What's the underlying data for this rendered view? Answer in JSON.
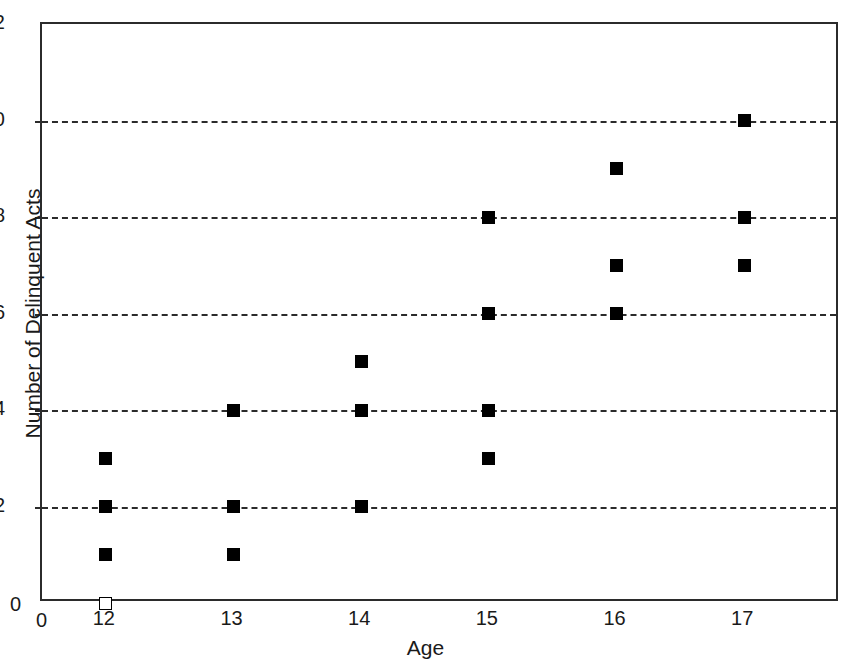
{
  "chart_data": {
    "type": "scatter",
    "title": "",
    "xlabel": "Age",
    "ylabel": "Number of Delinquent Acts",
    "xlim": [
      11.5,
      17.75
    ],
    "ylim": [
      0,
      12
    ],
    "x_ticks": [
      "0",
      "12",
      "13",
      "14",
      "15",
      "16",
      "17"
    ],
    "y_ticks": [
      "0",
      "2",
      "4",
      "6",
      "8",
      "10",
      "12"
    ],
    "grid": "horizontal dashed gridlines at y = 2, 4, 6, 8, 10",
    "legend": "none",
    "axis_break": "x-axis origin labeled 0, then jumps to 12",
    "marker_styles": {
      "filled": "solid black square",
      "open": "white square with black outline"
    },
    "points": [
      {
        "x": 12,
        "y": 3,
        "style": "filled"
      },
      {
        "x": 12,
        "y": 2,
        "style": "filled"
      },
      {
        "x": 12,
        "y": 1,
        "style": "filled"
      },
      {
        "x": 12,
        "y": 0,
        "style": "open"
      },
      {
        "x": 13,
        "y": 4,
        "style": "filled"
      },
      {
        "x": 13,
        "y": 2,
        "style": "filled"
      },
      {
        "x": 13,
        "y": 1,
        "style": "filled"
      },
      {
        "x": 14,
        "y": 5,
        "style": "filled"
      },
      {
        "x": 14,
        "y": 4,
        "style": "filled"
      },
      {
        "x": 14,
        "y": 2,
        "style": "filled"
      },
      {
        "x": 15,
        "y": 8,
        "style": "filled"
      },
      {
        "x": 15,
        "y": 6,
        "style": "filled"
      },
      {
        "x": 15,
        "y": 4,
        "style": "filled"
      },
      {
        "x": 15,
        "y": 3,
        "style": "filled"
      },
      {
        "x": 16,
        "y": 9,
        "style": "filled"
      },
      {
        "x": 16,
        "y": 7,
        "style": "filled"
      },
      {
        "x": 16,
        "y": 6,
        "style": "filled"
      },
      {
        "x": 17,
        "y": 10,
        "style": "filled"
      },
      {
        "x": 17,
        "y": 8,
        "style": "filled"
      },
      {
        "x": 17,
        "y": 7,
        "style": "filled"
      }
    ],
    "gridline_values": [
      2,
      4,
      6,
      8,
      10
    ]
  },
  "origin": {
    "zero_y": "0",
    "zero_x": "0"
  },
  "colors": {
    "axis": "#2b2b2b",
    "marker": "#000000",
    "background": "#ffffff"
  }
}
